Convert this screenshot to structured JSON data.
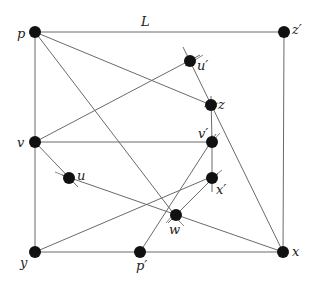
{
  "diagram": {
    "type": "graph",
    "edge_label": "L",
    "nodes": [
      {
        "id": "p",
        "label": "p",
        "x": 35,
        "y": 32
      },
      {
        "id": "z'",
        "label": "z′",
        "x": 284,
        "y": 32
      },
      {
        "id": "u'",
        "label": "u′",
        "x": 190,
        "y": 61
      },
      {
        "id": "z",
        "label": "z",
        "x": 211,
        "y": 105
      },
      {
        "id": "v",
        "label": "v",
        "x": 35,
        "y": 142
      },
      {
        "id": "v'",
        "label": "v′",
        "x": 212,
        "y": 142
      },
      {
        "id": "u",
        "label": "u",
        "x": 69,
        "y": 178
      },
      {
        "id": "x'",
        "label": "x′",
        "x": 212,
        "y": 178
      },
      {
        "id": "w",
        "label": "w",
        "x": 176,
        "y": 215
      },
      {
        "id": "y",
        "label": "y",
        "x": 35,
        "y": 252
      },
      {
        "id": "p'",
        "label": "p′",
        "x": 140,
        "y": 252
      },
      {
        "id": "x",
        "label": "x",
        "x": 283,
        "y": 252
      }
    ],
    "edges": [
      [
        "p",
        "z'"
      ],
      [
        "p",
        "y"
      ],
      [
        "z'",
        "x"
      ],
      [
        "y",
        "x"
      ],
      [
        "v",
        "v'"
      ],
      [
        "p",
        "z"
      ],
      [
        "p",
        "w"
      ],
      [
        "v",
        "u'"
      ],
      [
        "v",
        "u"
      ],
      [
        "u",
        "x"
      ],
      [
        "y",
        "x'"
      ],
      [
        "w",
        "x'"
      ],
      [
        "p'",
        "v'"
      ],
      [
        "v'",
        "x'"
      ],
      [
        "z",
        "v'"
      ],
      [
        "u'",
        "x"
      ]
    ]
  }
}
